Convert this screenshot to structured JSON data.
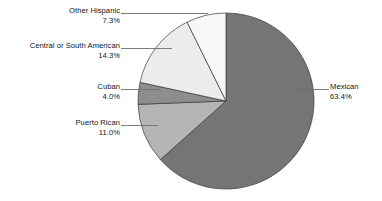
{
  "chart_data": {
    "type": "pie",
    "title": "",
    "subtitle": "",
    "xlabel": "",
    "ylabel": "",
    "legend_position": "callout-labels",
    "grid": false,
    "start_angle_deg": 90,
    "direction": "mexican-clockwise-others-counterclockwise",
    "categories": [
      "Mexican",
      "Puerto Rican",
      "Cuban",
      "Central or South American",
      "Other Hispanic"
    ],
    "values": [
      63.4,
      11.0,
      4.0,
      14.3,
      7.3
    ],
    "value_labels": [
      "63.4%",
      "11.0%",
      "4.0%",
      "14.3%",
      "7.3%"
    ],
    "colors": [
      "#757575",
      "#b5b5b5",
      "#8e8e8e",
      "#ececec",
      "#f7f7f7"
    ],
    "slice_outline_color": "#3a3a3a",
    "leader_line_color": "#6f6f6f",
    "background_color": "#ffffff",
    "slices": [
      {
        "name": "Mexican",
        "value": 63.4,
        "label": "Mexican",
        "percent_label": "63.4%",
        "color": "#757575"
      },
      {
        "name": "Puerto Rican",
        "value": 11.0,
        "label": "Puerto Rican",
        "percent_label": "11.0%",
        "color": "#b5b5b5"
      },
      {
        "name": "Cuban",
        "value": 4.0,
        "label": "Cuban",
        "percent_label": "4.0%",
        "color": "#8e8e8e"
      },
      {
        "name": "Central or South American",
        "value": 14.3,
        "label": "Central or South American",
        "percent_label": "14.3%",
        "color": "#ececec"
      },
      {
        "name": "Other Hispanic",
        "value": 7.3,
        "label": "Other Hispanic",
        "percent_label": "7.3%",
        "color": "#f7f7f7"
      }
    ]
  },
  "callouts": {
    "other_hispanic": {
      "category": "Other Hispanic",
      "percent": "7.3%"
    },
    "central_south": {
      "category": "Central or South American",
      "percent": "14.3%"
    },
    "cuban": {
      "category": "Cuban",
      "percent": "4.0%"
    },
    "puerto_rican": {
      "category": "Puerto Rican",
      "percent": "11.0%"
    },
    "mexican": {
      "category": "Mexican",
      "percent": "63.4%"
    }
  }
}
